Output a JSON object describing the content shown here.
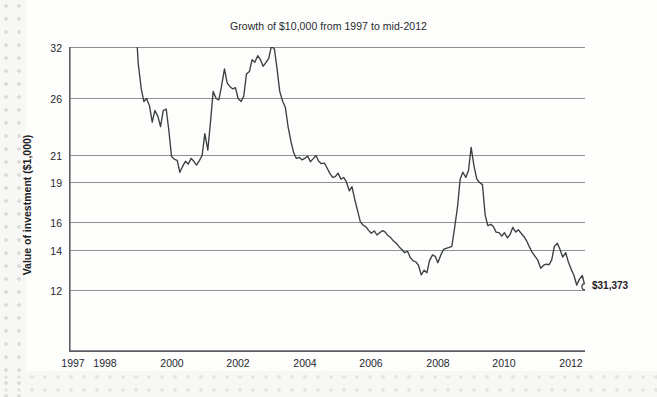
{
  "chart_data": {
    "type": "line",
    "title": "Growth of $10,000 from 1997 to mid-2012",
    "xlabel": "",
    "ylabel": "Value of investment ($1,000)",
    "grid": "horizontal",
    "legend_position": "none",
    "scale": "log-like irregular y ticks",
    "ylim": [
      9.5,
      32
    ],
    "xlim": [
      1997.0,
      2012.5
    ],
    "y_ticks": [
      12,
      14,
      16,
      19,
      21,
      26,
      32
    ],
    "y_tick_labels": [
      "12",
      "14",
      "16",
      "19",
      "21",
      "26",
      "32"
    ],
    "x_ticks": [
      1997,
      1998,
      1999,
      2000,
      2001,
      2002,
      2003,
      2004,
      2005,
      2006,
      2007,
      2008,
      2009,
      2010,
      2011,
      2012
    ],
    "x_tick_labels_shown": [
      "1997",
      "1998",
      "2000",
      "2002",
      "2004",
      "2006",
      "2008",
      "2010",
      "2012"
    ],
    "annotations": [
      {
        "text": "$31,373",
        "x": 2012.5,
        "y": 31.373,
        "marker": "open-circle"
      }
    ],
    "series": [
      {
        "name": "Value of investment",
        "color": "#3a3f44",
        "x": [
          1997.0,
          1997.08,
          1997.17,
          1997.25,
          1997.33,
          1997.42,
          1997.5,
          1997.58,
          1997.67,
          1997.75,
          1997.83,
          1997.92,
          1998.0,
          1998.08,
          1998.17,
          1998.25,
          1998.33,
          1998.42,
          1998.5,
          1998.58,
          1998.67,
          1998.75,
          1998.83,
          1998.92,
          1999.0,
          1999.08,
          1999.17,
          1999.25,
          1999.33,
          1999.42,
          1999.5,
          1999.58,
          1999.67,
          1999.75,
          1999.83,
          1999.92,
          2000.0,
          2000.08,
          2000.17,
          2000.25,
          2000.33,
          2000.42,
          2000.5,
          2000.58,
          2000.67,
          2000.75,
          2000.83,
          2000.92,
          2001.0,
          2001.08,
          2001.17,
          2001.25,
          2001.33,
          2001.42,
          2001.5,
          2001.58,
          2001.67,
          2001.75,
          2001.83,
          2001.92,
          2002.0,
          2002.08,
          2002.17,
          2002.25,
          2002.33,
          2002.42,
          2002.5,
          2002.58,
          2002.67,
          2002.75,
          2002.83,
          2002.92,
          2003.0,
          2003.08,
          2003.17,
          2003.25,
          2003.33,
          2003.42,
          2003.5,
          2003.58,
          2003.67,
          2003.75,
          2003.83,
          2003.92,
          2004.0,
          2004.08,
          2004.17,
          2004.25,
          2004.33,
          2004.42,
          2004.5,
          2004.58,
          2004.67,
          2004.75,
          2004.83,
          2004.92,
          2005.0,
          2005.08,
          2005.17,
          2005.25,
          2005.33,
          2005.42,
          2005.5,
          2005.58,
          2005.67,
          2005.75,
          2005.83,
          2005.92,
          2006.0,
          2006.08,
          2006.17,
          2006.25,
          2006.33,
          2006.42,
          2006.5,
          2006.58,
          2006.67,
          2006.75,
          2006.83,
          2006.92,
          2007.0,
          2007.08,
          2007.17,
          2007.25,
          2007.33,
          2007.42,
          2007.5,
          2007.58,
          2007.67,
          2007.75,
          2007.83,
          2007.92,
          2008.0,
          2008.08,
          2008.17,
          2008.25,
          2008.33,
          2008.42,
          2008.5,
          2008.58,
          2008.67,
          2008.75,
          2008.83,
          2008.92,
          2009.0,
          2009.08,
          2009.17,
          2009.25,
          2009.33,
          2009.42,
          2009.5,
          2009.58,
          2009.67,
          2009.75,
          2009.83,
          2009.92,
          2010.0,
          2010.08,
          2010.17,
          2010.25,
          2010.33,
          2010.42,
          2010.5,
          2010.58,
          2010.67,
          2010.75,
          2010.83,
          2010.92,
          2011.0,
          2011.08,
          2011.17,
          2011.25,
          2011.33,
          2011.42,
          2011.5,
          2011.58,
          2011.67,
          2011.75,
          2011.83,
          2011.92,
          2012.0,
          2012.08,
          2012.17,
          2012.25,
          2012.33,
          2012.42,
          2012.5
        ],
        "y": [
          10.0,
          10.15,
          10.05,
          10.25,
          10.1,
          9.95,
          9.85,
          9.8,
          9.78,
          9.8,
          9.82,
          9.85,
          9.8,
          9.85,
          10.0,
          10.3,
          10.6,
          11.3,
          11.95,
          11.4,
          10.8,
          11.3,
          10.5,
          10.0,
          11.0,
          12.6,
          13.6,
          14.1,
          14.0,
          14.25,
          14.8,
          14.4,
          14.6,
          14.95,
          14.4,
          14.35,
          15.1,
          16.1,
          16.4,
          16.5,
          17.8,
          17.1,
          16.6,
          16.9,
          16.3,
          16.6,
          17.0,
          16.5,
          16.0,
          15.2,
          15.8,
          14.8,
          13.7,
          14.0,
          14.05,
          13.5,
          12.8,
          13.35,
          13.5,
          13.6,
          13.55,
          14.0,
          14.1,
          13.9,
          13.0,
          12.9,
          12.45,
          12.55,
          12.3,
          12.45,
          12.7,
          12.55,
          12.4,
          11.95,
          12.05,
          12.8,
          13.7,
          14.1,
          14.3,
          14.95,
          15.5,
          15.9,
          16.3,
          16.2,
          16.45,
          16.3,
          16.05,
          16.65,
          16.35,
          16.0,
          16.6,
          16.85,
          16.8,
          17.3,
          17.9,
          18.4,
          18.3,
          17.9,
          18.6,
          18.4,
          18.9,
          19.4,
          19.2,
          19.8,
          20.4,
          20.95,
          21.4,
          21.7,
          22.3,
          22.8,
          22.4,
          23.1,
          22.7,
          22.35,
          22.6,
          23.2,
          23.6,
          24.2,
          24.6,
          25.3,
          25.8,
          26.3,
          26.1,
          26.95,
          27.4,
          27.6,
          28.1,
          29.5,
          28.8,
          29.2,
          27.4,
          26.6,
          26.8,
          27.7,
          26.6,
          25.8,
          25.6,
          25.4,
          25.2,
          22.0,
          20.2,
          18.6,
          17.8,
          18.4,
          17.6,
          15.7,
          17.2,
          18.6,
          19.0,
          19.1,
          20.6,
          21.5,
          21.3,
          21.7,
          22.6,
          22.7,
          23.3,
          22.7,
          23.6,
          23.0,
          21.8,
          22.6,
          22.2,
          22.8,
          23.4,
          24.2,
          25.3,
          26.3,
          26.8,
          27.3,
          28.5,
          28.1,
          27.9,
          28.0,
          27.3,
          25.2,
          24.6,
          25.8,
          26.9,
          26.3,
          27.6,
          28.6,
          29.6,
          31.1,
          30.2,
          29.6,
          31.37
        ]
      }
    ]
  },
  "axes": {
    "y_tick_labels": [
      "32",
      "26",
      "21",
      "19",
      "16",
      "14",
      "12"
    ],
    "y_tick_tops": [
      42,
      93,
      150,
      177,
      217,
      245,
      285
    ],
    "x_tick_labels": [
      "1997",
      "1998",
      "2000",
      "2002",
      "2004",
      "2006",
      "2008",
      "2010",
      "2012"
    ],
    "x_tick_lefts": [
      73,
      105,
      172,
      238,
      305,
      371,
      438,
      504,
      571
    ]
  },
  "endpoint": {
    "label": "$31,373"
  },
  "colors": {
    "line": "#3a3f44",
    "grid": "#8d9298",
    "axis": "#5b6064",
    "text": "#25292c",
    "page": "#fdfdfc"
  }
}
